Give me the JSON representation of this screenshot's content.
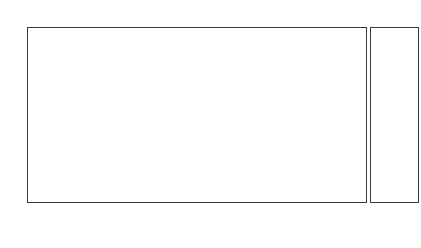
{
  "chart_data": {
    "type": "bar",
    "subtype": "stacked-100-percent",
    "subtitle": "(Source: Statistics Estonia).",
    "xlabel": "",
    "ylabel": "",
    "ylim": [
      0,
      100
    ],
    "ytick_labels": [
      "100%",
      "90%",
      "80%",
      "70%",
      "60%",
      "50%",
      "40%",
      "30%",
      "20%",
      "10%",
      "0%"
    ],
    "ytick_values": [
      100,
      90,
      80,
      70,
      60,
      50,
      40,
      30,
      20,
      10,
      0
    ],
    "grid": false,
    "legend_position": "right",
    "categories": [
      "Finland",
      "Sweden",
      "Denmark",
      "Norway",
      "Germany",
      "UK",
      "France",
      "Italy",
      "USA, Canada",
      "Russia",
      "Latvia",
      "Lithuania",
      "others",
      "total"
    ],
    "series": [
      {
        "name": "63+",
        "color": "#a6a6a6",
        "values": [
          10,
          13,
          5,
          9,
          18,
          7,
          5,
          7,
          7,
          16,
          3,
          3,
          9,
          9
        ]
      },
      {
        "name": "55-64",
        "color": "#333333",
        "values": [
          20,
          22,
          16,
          21,
          18,
          17,
          15,
          5,
          16,
          22,
          7,
          7,
          15,
          18
        ]
      },
      {
        "name": "45-54",
        "color": "#ffffff",
        "values": [
          30,
          23,
          11,
          23,
          20,
          17,
          22,
          13,
          22,
          17,
          17,
          23,
          15,
          23
        ]
      },
      {
        "name": "35-44",
        "color": "#e9e9e9",
        "values": [
          22,
          23,
          28,
          23,
          18,
          22,
          17,
          20,
          29,
          20,
          36,
          39,
          26,
          24
        ]
      },
      {
        "name": "25-34",
        "color": "#8f8f8f",
        "values": [
          12,
          15,
          20,
          16,
          16,
          28,
          29,
          40,
          21,
          24,
          34,
          28,
          28,
          19
        ]
      },
      {
        "name": "15-24",
        "color": "#bdbdbd",
        "values": [
          7,
          5,
          18,
          7,
          9,
          9,
          12,
          14,
          6,
          6,
          4,
          5,
          8,
          7
        ]
      }
    ]
  }
}
